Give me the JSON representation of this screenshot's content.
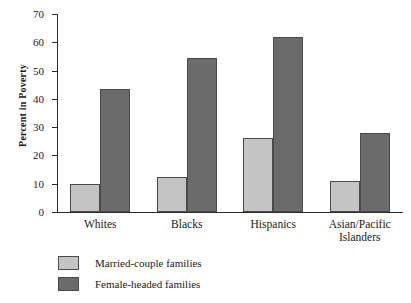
{
  "chart_data": {
    "type": "bar",
    "title": "",
    "xlabel": "",
    "ylabel": "Percent in Poverty",
    "categories": [
      "Whites",
      "Blacks",
      "Hispanics",
      "Asian/Pacific Islanders"
    ],
    "series": [
      {
        "name": "Married-couple families",
        "color": "#c4c4c4",
        "values": [
          10,
          12.5,
          26,
          11
        ]
      },
      {
        "name": "Female-headed families",
        "color": "#6b6b6b",
        "values": [
          43.5,
          54.5,
          62,
          28
        ]
      }
    ],
    "ylim": [
      0,
      70
    ],
    "ytick_values": [
      0,
      10,
      20,
      30,
      40,
      50,
      60,
      70
    ],
    "ytick_labels": [
      "0",
      "10",
      "20",
      "30",
      "40",
      "50",
      "60",
      "70"
    ],
    "grid": false,
    "legend_position": "below-left",
    "axis_color": "#2b2b2b",
    "bar_edge_color": "#4a4a4a",
    "background": "#ffffff"
  }
}
